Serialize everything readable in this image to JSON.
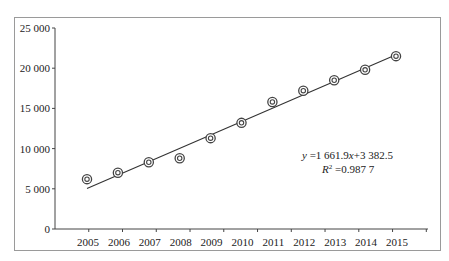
{
  "chart_data": {
    "type": "scatter",
    "title": "",
    "xlabel": "",
    "ylabel": "",
    "categories": [
      "2005",
      "2006",
      "2007",
      "2008",
      "2009",
      "2010",
      "2011",
      "2012",
      "2013",
      "2014",
      "2015"
    ],
    "series": [
      {
        "name": "observed",
        "marker": "double-circle",
        "values": [
          6200,
          7000,
          8300,
          8800,
          11300,
          13200,
          15800,
          17200,
          18500,
          19800,
          21500
        ]
      },
      {
        "name": "linear trendline",
        "type": "line",
        "equation": "y = 1 661.9x + 3 382.5",
        "slope": 1661.9,
        "intercept": 3382.5,
        "r_squared": 0.9877
      }
    ],
    "y_ticks": [
      "0",
      "5 000",
      "10 000",
      "15 000",
      "20 000",
      "25 000"
    ],
    "ylim": [
      0,
      25000
    ],
    "grid": false,
    "legend": "none",
    "annotations": {
      "equation_label": "y =1 661.9x+3 382.5",
      "r2_label": "R² =0.987 7"
    }
  }
}
